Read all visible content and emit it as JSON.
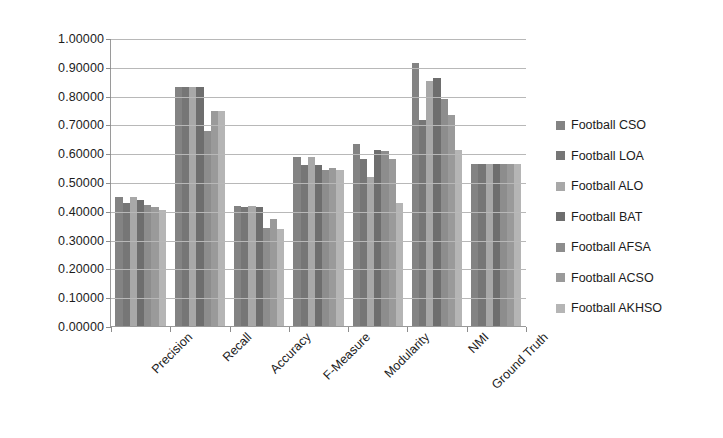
{
  "chart_data": {
    "type": "bar",
    "title": "",
    "xlabel": "",
    "ylabel": "",
    "ylim": [
      0,
      1
    ],
    "grid": true,
    "legend_position": "right",
    "ytick_labels": [
      "1.00000",
      "0.90000",
      "0.80000",
      "0.70000",
      "0.60000",
      "0.50000",
      "0.40000",
      "0.30000",
      "0.20000",
      "0.10000",
      "0.00000"
    ],
    "ytick_values": [
      1.0,
      0.9,
      0.8,
      0.7,
      0.6,
      0.5,
      0.4,
      0.3,
      0.2,
      0.1,
      0.0
    ],
    "categories": [
      "Precision",
      "Recall",
      "Accuracy",
      "F-Measure",
      "Modularity",
      "NMI",
      "Ground Truth"
    ],
    "series": [
      {
        "name": "Football CSO",
        "color": "#838383",
        "values": [
          0.452,
          0.835,
          0.42,
          0.59,
          0.635,
          0.915,
          0.565
        ]
      },
      {
        "name": "Football LOA",
        "color": "#767676",
        "values": [
          0.432,
          0.835,
          0.415,
          0.562,
          0.585,
          0.72,
          0.565
        ]
      },
      {
        "name": "Football ALO",
        "color": "#a8a8a8",
        "values": [
          0.452,
          0.835,
          0.42,
          0.59,
          0.52,
          0.855,
          0.565
        ]
      },
      {
        "name": "Football BAT",
        "color": "#6e6e6e",
        "values": [
          0.44,
          0.835,
          0.415,
          0.562,
          0.615,
          0.865,
          0.565
        ]
      },
      {
        "name": "Football AFSA",
        "color": "#8d8d8d",
        "values": [
          0.425,
          0.68,
          0.345,
          0.545,
          0.61,
          0.79,
          0.565
        ]
      },
      {
        "name": "Football ACSO",
        "color": "#9a9a9a",
        "values": [
          0.415,
          0.75,
          0.375,
          0.552,
          0.585,
          0.735,
          0.565
        ]
      },
      {
        "name": "Football AKHSO",
        "color": "#b5b5b5",
        "values": [
          0.408,
          0.75,
          0.34,
          0.545,
          0.43,
          0.615,
          0.565
        ]
      }
    ]
  },
  "legend": {
    "items": [
      {
        "label": "Football CSO"
      },
      {
        "label": "Football LOA"
      },
      {
        "label": "Football ALO"
      },
      {
        "label": "Football BAT"
      },
      {
        "label": "Football AFSA"
      },
      {
        "label": "Football ACSO"
      },
      {
        "label": "Football AKHSO"
      }
    ]
  },
  "colors": {
    "background": "#ffffff",
    "gridline": "#b8b8b8",
    "axis": "#9a9a9a",
    "text": "#1c1c1c"
  }
}
